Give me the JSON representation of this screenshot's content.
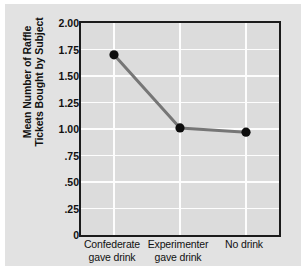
{
  "chart_data": {
    "type": "line",
    "title": "",
    "subtitle": "",
    "xlabel": "",
    "ylabel": "Mean Number of Raffle Tickets Bought by Subject",
    "ylabel_lines": [
      "Mean Number of Raffle",
      "Tickets Bought by Subject"
    ],
    "categories": [
      "Confederate gave drink",
      "Experimenter gave drink",
      "No drink"
    ],
    "category_lines": [
      [
        "Confederate",
        "gave drink"
      ],
      [
        "Experimenter",
        "gave drink"
      ],
      [
        "No drink",
        ""
      ]
    ],
    "values": [
      1.7,
      1.01,
      0.97
    ],
    "ylim": [
      0,
      2.0
    ],
    "ytick_values": [
      2.0,
      1.75,
      1.5,
      1.25,
      1.0,
      0.75,
      0.5,
      0.25,
      0
    ],
    "ytick_labels": [
      "2.00",
      "1.75",
      "1.50",
      "1.25",
      "1.00",
      ".75",
      ".50",
      ".25",
      "0"
    ],
    "grid": true,
    "grid_color": "#fdfdfd",
    "legend": "none",
    "line_color": "#767676",
    "marker_color": "#0d0d0d",
    "marker_shape": "circle",
    "plot_background": "#dcdcdc",
    "figure_background": "#e2e2e2",
    "axis_color": "#1b1b1b"
  }
}
